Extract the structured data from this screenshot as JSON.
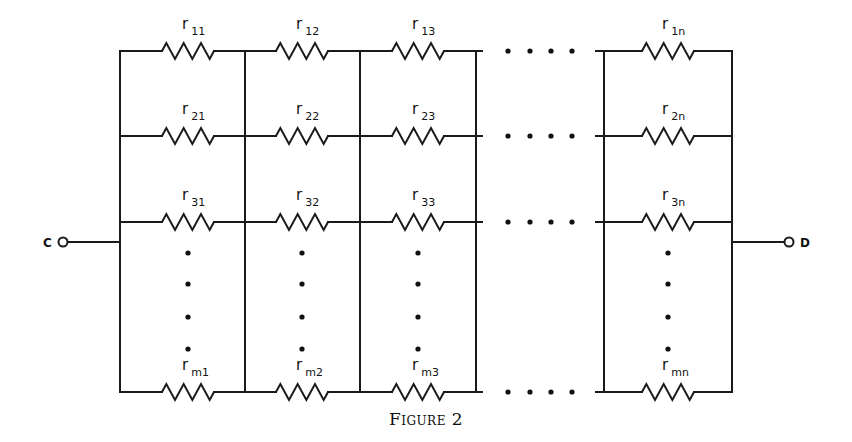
{
  "figure": {
    "caption": "Figure 2",
    "type": "resistor network (m rows × n columns between terminals C and D)"
  },
  "terminals": {
    "left": {
      "label": "C",
      "x": 63,
      "y": 242
    },
    "right": {
      "label": "D",
      "x": 789,
      "y": 242
    }
  },
  "geometry": {
    "bus_left_x": 120,
    "bus_right_x": 732,
    "column_dividers_x": [
      120,
      245,
      360,
      476,
      604,
      732
    ],
    "rows_y": [
      51,
      136,
      222,
      392
    ],
    "top_y": 51,
    "bottom_y": 392,
    "resistor_half_width": 26,
    "resistor_amplitude": 8,
    "stroke_color": "#1a1a1a"
  },
  "columns": [
    {
      "id": "1",
      "center_x": 188
    },
    {
      "id": "2",
      "center_x": 302
    },
    {
      "id": "3",
      "center_x": 418
    },
    {
      "id": "n",
      "center_x": 668
    }
  ],
  "rows": [
    {
      "id": "1",
      "y": 51
    },
    {
      "id": "2",
      "y": 136
    },
    {
      "id": "3",
      "y": 222
    },
    {
      "id": "m",
      "y": 392
    }
  ],
  "resistors": [
    {
      "row": "1",
      "col": "1",
      "symbol": "r",
      "subscript": "11"
    },
    {
      "row": "1",
      "col": "2",
      "symbol": "r",
      "subscript": "12"
    },
    {
      "row": "1",
      "col": "3",
      "symbol": "r",
      "subscript": "13"
    },
    {
      "row": "1",
      "col": "n",
      "symbol": "r",
      "subscript": "1n"
    },
    {
      "row": "2",
      "col": "1",
      "symbol": "r",
      "subscript": "21"
    },
    {
      "row": "2",
      "col": "2",
      "symbol": "r",
      "subscript": "22"
    },
    {
      "row": "2",
      "col": "3",
      "symbol": "r",
      "subscript": "23"
    },
    {
      "row": "2",
      "col": "n",
      "symbol": "r",
      "subscript": "2n"
    },
    {
      "row": "3",
      "col": "1",
      "symbol": "r",
      "subscript": "31"
    },
    {
      "row": "3",
      "col": "2",
      "symbol": "r",
      "subscript": "32"
    },
    {
      "row": "3",
      "col": "3",
      "symbol": "r",
      "subscript": "33"
    },
    {
      "row": "3",
      "col": "n",
      "symbol": "r",
      "subscript": "3n"
    },
    {
      "row": "m",
      "col": "1",
      "symbol": "r",
      "subscript": "m1"
    },
    {
      "row": "m",
      "col": "2",
      "symbol": "r",
      "subscript": "m2"
    },
    {
      "row": "m",
      "col": "3",
      "symbol": "r",
      "subscript": "m3"
    },
    {
      "row": "m",
      "col": "n",
      "symbol": "r",
      "subscript": "mn"
    }
  ],
  "ellipsis": {
    "horizontal_dots_x": [
      508,
      530,
      551,
      572
    ],
    "vertical_dots_y": [
      253,
      284,
      317,
      349
    ]
  }
}
